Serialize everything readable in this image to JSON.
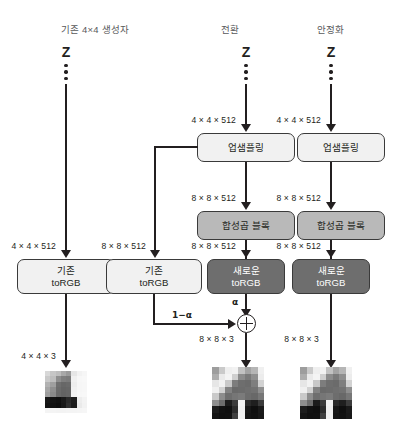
{
  "diagram": {
    "columns": [
      {
        "id": "existing",
        "header": "기존 4×4 생성자"
      },
      {
        "id": "transition",
        "header": "전환"
      },
      {
        "id": "stabilization",
        "header": "안정화"
      }
    ],
    "latent_label": "Z",
    "shapes": {
      "in_4_4_512": "4 × 4 × 512",
      "out_8_8_512": "8 × 8 × 512",
      "out_4_4_3": "4 × 4 × 3",
      "out_8_8_3": "8 × 8 × 3"
    },
    "blocks": {
      "upsample": {
        "line1": "업샘플링",
        "line2": "",
        "style": "light"
      },
      "conv": {
        "line1": "합성곱 블록",
        "line2": "",
        "style": "mid"
      },
      "old_rgb": {
        "line1": "기존",
        "line2": "toRGB",
        "style": "light"
      },
      "new_rgb": {
        "line1": "새로운",
        "line2": "toRGB",
        "style": "dark"
      }
    },
    "blend": {
      "alpha": "α",
      "one_minus_alpha": "1−α",
      "operator": "⊕"
    },
    "colors": {
      "stroke": "#231f20",
      "block_light": "#f1f1f1",
      "block_mid": "#b9b9b9",
      "block_dark": "#6e6e6e",
      "header_text": "#58595b",
      "background": "#ffffff"
    },
    "outputs": [
      {
        "id": "out-left",
        "shape": "4 × 4 × 3",
        "cols": 8,
        "rows": 8,
        "pixels": [
          "#d8d8d8",
          "#c6c6c6",
          "#bdbdbd",
          "#a8a8a8",
          "#9a9a9a",
          "#e6e6e6",
          "#f2f2f2",
          "#f6f6f6",
          "#c9c9c9",
          "#bdbdbd",
          "#8e8e8e",
          "#7f7f7f",
          "#7b7b7b",
          "#f0f0f0",
          "#f7f7f7",
          "#f8f8f8",
          "#b2b2b2",
          "#9f9f9f",
          "#6f6f6f",
          "#676767",
          "#6a6a6a",
          "#ededed",
          "#f6f6f6",
          "#f7f7f7",
          "#a6a6a6",
          "#8f8f8f",
          "#6b6b6b",
          "#646464",
          "#666666",
          "#f0f0f0",
          "#f6f6f6",
          "#f7f7f7",
          "#9e9e9e",
          "#8a8a8a",
          "#6a6a6a",
          "#636363",
          "#666666",
          "#f2f2f2",
          "#f7f7f7",
          "#f8f8f8",
          "#171717",
          "#131313",
          "#101010",
          "#1a1a1a",
          "#2a2a2a",
          "#1d1d1d",
          "#ededed",
          "#f3f3f3",
          "#131313",
          "#101010",
          "#0d0d0d",
          "#181818",
          "#2f2f2f",
          "#1b1b1b",
          "#eaeaea",
          "#f2f2f2",
          "#f4f4f4",
          "#f4f4f4",
          "#f3f3f3",
          "#f3f3f3",
          "#f4f4f4",
          "#f4f4f4",
          "#f5f5f5",
          "#f6f6f6"
        ]
      },
      {
        "id": "out-middle",
        "shape": "8 × 8 × 3",
        "cols": 8,
        "rows": 8,
        "pixels": [
          "#9d9d9d",
          "#cacaca",
          "#efefef",
          "#f2f2f2",
          "#c2c2c2",
          "#a3a3a3",
          "#b5b5b5",
          "#f0f0f0",
          "#adadad",
          "#eaeaea",
          "#f4f4f4",
          "#cfcfcf",
          "#8c8c8c",
          "#7a7a7a",
          "#8f8f8f",
          "#ececec",
          "#e6e6e6",
          "#f2f2f2",
          "#c9c9c9",
          "#7d7d7d",
          "#6e6e6e",
          "#6b6b6b",
          "#7e7e7e",
          "#d2d2d2",
          "#f0f0f0",
          "#d2d2d2",
          "#828282",
          "#6a6a6a",
          "#6c6c6c",
          "#6f6f6f",
          "#727272",
          "#8e8e8e",
          "#c9c9c9",
          "#8d8d8d",
          "#6e6e6e",
          "#767676",
          "#7b7b7b",
          "#6d6d6d",
          "#686868",
          "#777777",
          "#8f8f8f",
          "#6d6d6d",
          "#1c1c1c",
          "#3a3a3a",
          "#f1f1f1",
          "#2a2a2a",
          "#1f1f1f",
          "#3c3c3c",
          "#1d1d1d",
          "#121212",
          "#0f0f0f",
          "#2b2b2b",
          "#efefef",
          "#171717",
          "#0f0f0f",
          "#1a1a1a",
          "#151515",
          "#101010",
          "#111111",
          "#3f3f3f",
          "#f0f0f0",
          "#141414",
          "#111111",
          "#181818"
        ]
      },
      {
        "id": "out-right",
        "shape": "8 × 8 × 3",
        "cols": 8,
        "rows": 8,
        "pixels": [
          "#9d9d9d",
          "#cacaca",
          "#efefef",
          "#f2f2f2",
          "#c2c2c2",
          "#a3a3a3",
          "#b5b5b5",
          "#f0f0f0",
          "#adadad",
          "#eaeaea",
          "#f4f4f4",
          "#cfcfcf",
          "#8c8c8c",
          "#7a7a7a",
          "#8f8f8f",
          "#ececec",
          "#e6e6e6",
          "#f2f2f2",
          "#c9c9c9",
          "#7d7d7d",
          "#6e6e6e",
          "#6b6b6b",
          "#7e7e7e",
          "#d2d2d2",
          "#f0f0f0",
          "#d2d2d2",
          "#828282",
          "#6a6a6a",
          "#6c6c6c",
          "#6f6f6f",
          "#727272",
          "#8e8e8e",
          "#c9c9c9",
          "#8d8d8d",
          "#6e6e6e",
          "#767676",
          "#7b7b7b",
          "#6d6d6d",
          "#686868",
          "#777777",
          "#8f8f8f",
          "#6d6d6d",
          "#1c1c1c",
          "#3a3a3a",
          "#f1f1f1",
          "#2a2a2a",
          "#1f1f1f",
          "#3c3c3c",
          "#1d1d1d",
          "#121212",
          "#0f0f0f",
          "#2b2b2b",
          "#efefef",
          "#171717",
          "#0f0f0f",
          "#1a1a1a",
          "#151515",
          "#101010",
          "#111111",
          "#3f3f3f",
          "#f0f0f0",
          "#141414",
          "#111111",
          "#181818"
        ]
      }
    ]
  }
}
